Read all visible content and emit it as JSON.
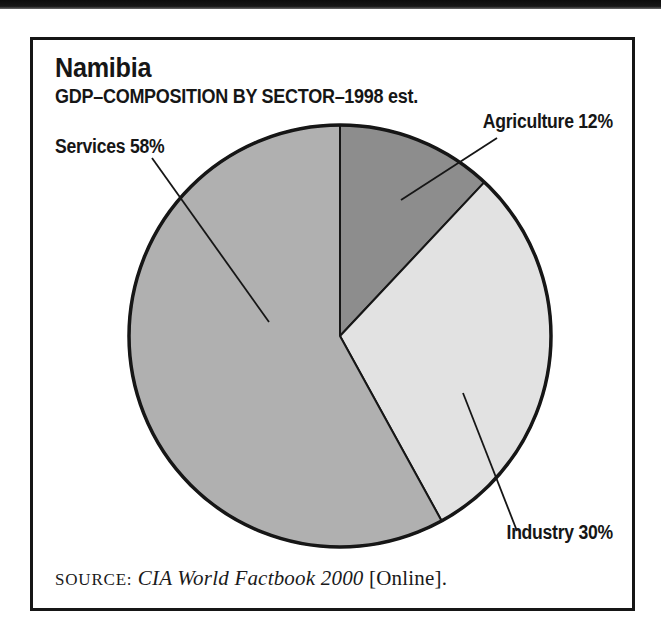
{
  "figure": {
    "title": "Namibia",
    "subtitle": "GDP–COMPOSITION BY SECTOR–1998 est.",
    "source_prefix": "SOURCE:",
    "source_work": "CIA World Factbook 2000",
    "source_suffix": "[Online]."
  },
  "colors": {
    "ink": "#161616",
    "background": "#ffffff",
    "agriculture_fill": "#8d8d8d",
    "industry_fill": "#e2e2e2",
    "services_fill": "#b0b0b0"
  },
  "chart_data": {
    "type": "pie",
    "title": "Namibia",
    "subtitle": "GDP–COMPOSITION BY SECTOR–1998 est.",
    "unit": "percent",
    "start_angle_deg": 0,
    "direction": "clockwise",
    "legend_position": "none",
    "slices": [
      {
        "label": "Agriculture",
        "value": 12,
        "display": "Agriculture 12%",
        "color": "#8d8d8d"
      },
      {
        "label": "Industry",
        "value": 30,
        "display": "Industry 30%",
        "color": "#e2e2e2"
      },
      {
        "label": "Services",
        "value": 58,
        "display": "Services 58%",
        "color": "#b0b0b0"
      }
    ],
    "source": "SOURCE: CIA World Factbook 2000 [Online]."
  }
}
